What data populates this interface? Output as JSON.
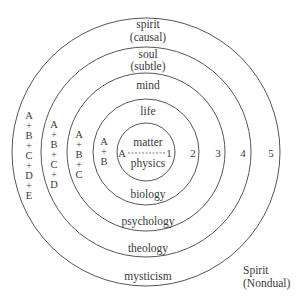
{
  "diagram": {
    "center": {
      "x": 146,
      "y": 152
    },
    "ring_color": "#555555",
    "rings": [
      {
        "level": 1,
        "radius": 29,
        "number": "1",
        "upper": "matter",
        "lower": "physics",
        "stack": "A"
      },
      {
        "level": 2,
        "radius": 53,
        "number": "2",
        "upper": "life",
        "lower": "biology",
        "stack": "A + B"
      },
      {
        "level": 3,
        "radius": 79,
        "number": "3",
        "upper": "mind",
        "lower": "psychology",
        "stack": "A + B + C"
      },
      {
        "level": 4,
        "radius": 105,
        "number": "4",
        "upper": "soul (subtle)",
        "lower": "theology",
        "stack": "A + B + C + D"
      },
      {
        "level": 5,
        "radius": 134,
        "number": "5",
        "upper": "spirit (causal)",
        "lower": "mysticism",
        "stack": "A + B + C + D + E"
      }
    ],
    "labels": {
      "matter": "matter",
      "physics": "physics",
      "life": "life",
      "biology": "biology",
      "mind": "mind",
      "psychology": "psychology",
      "soul": "soul",
      "subtle": "(subtle)",
      "theology": "theology",
      "spirit": "spirit",
      "causal": "(causal)",
      "mysticism": "mysticism",
      "nondual_1": "Spirit",
      "nondual_2": "(Nondual)"
    },
    "numbers": [
      "1",
      "2",
      "3",
      "4",
      "5"
    ],
    "stacks": {
      "s1": [
        "A"
      ],
      "s2": [
        "A",
        "+",
        "B"
      ],
      "s3": [
        "A",
        "+",
        "B",
        "+",
        "C"
      ],
      "s4": [
        "A",
        "+",
        "B",
        "+",
        "C",
        "+",
        "D"
      ],
      "s5": [
        "A",
        "+",
        "B",
        "+",
        "C",
        "+",
        "D",
        "+",
        "E"
      ]
    }
  }
}
